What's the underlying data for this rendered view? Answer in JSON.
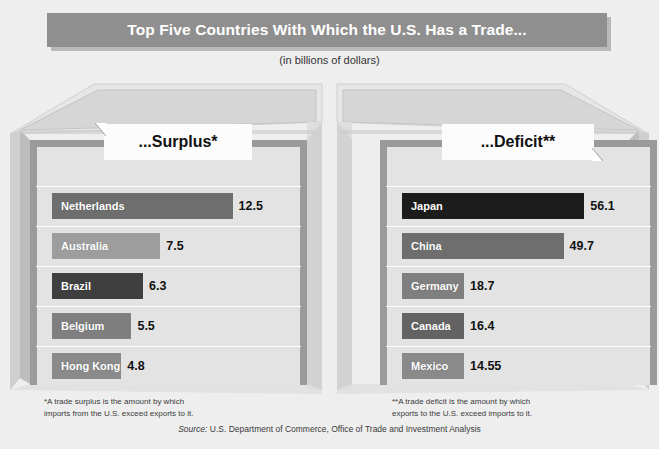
{
  "header": {
    "title": "Top Five Countries With Which the U.S. Has a Trade...",
    "subtitle": "(in billions of dollars)"
  },
  "panels": {
    "left": {
      "tag": "...Surplus*"
    },
    "right": {
      "tag": "...Deficit**"
    }
  },
  "footnotes": {
    "left": "*A trade surplus is the amount by which\n imports from the U.S. exceed exports to it.",
    "right": "**A trade deficit is the amount by which\n exports to the U.S. exceed imports to it."
  },
  "source": {
    "label": "Source:",
    "text": " U.S. Department of Commerce, Office of Trade and Investment Analysis"
  },
  "colors": {
    "canvas": "#eeeeee",
    "banner": "#8f8f8f",
    "plate": "#e3e3e3",
    "bar_dark": "#4a4a4a",
    "bar_darkest": "#1c1c1c",
    "bar_mid": "#7b7b7b",
    "bar_light": "#9d9d9d"
  },
  "chart_data": {
    "type": "bar",
    "title": "Top Five Countries With Which the U.S. Has a Trade...",
    "subtitle": "(in billions of dollars)",
    "xlabel": "",
    "ylabel": "",
    "unit": "billions of dollars",
    "orientation": "horizontal",
    "grid": true,
    "legend": "none",
    "panels": [
      {
        "name": "Surplus",
        "tag": "...Surplus*",
        "categories": [
          "Netherlands",
          "Australia",
          "Brazil",
          "Belgium",
          "Hong Kong"
        ],
        "values": [
          12.5,
          7.5,
          6.3,
          5.5,
          4.8
        ],
        "value_labels": [
          "12.5",
          "7.5",
          "6.3",
          "5.5",
          "4.8"
        ],
        "bar_colors": [
          "#6e6e6e",
          "#9d9d9d",
          "#3f3f3f",
          "#7f7f7f",
          "#8a8a8a"
        ],
        "xlim": [
          0,
          13.5
        ]
      },
      {
        "name": "Deficit",
        "tag": "...Deficit**",
        "categories": [
          "Japan",
          "China",
          "Germany",
          "Canada",
          "Mexico"
        ],
        "values": [
          56.1,
          49.7,
          18.7,
          16.4,
          14.55
        ],
        "value_labels": [
          "56.1",
          "49.7",
          "18.7",
          "16.4",
          "14.55"
        ],
        "bar_colors": [
          "#1c1c1c",
          "#6e6e6e",
          "#7f7f7f",
          "#636363",
          "#8a8a8a"
        ],
        "xlim": [
          0,
          60
        ]
      }
    ]
  }
}
